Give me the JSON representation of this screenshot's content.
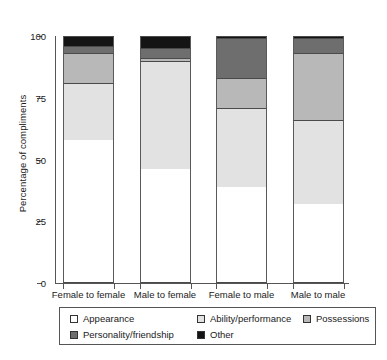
{
  "chart_data": {
    "type": "bar",
    "subtype": "stacked-bar-100-percent",
    "title": "",
    "xlabel": "",
    "ylabel": "Percentage of compliments",
    "ylim": [
      0,
      100
    ],
    "yticks": [
      0,
      25,
      50,
      75,
      100
    ],
    "ytick_labels": [
      "0",
      "25",
      "50",
      "75",
      "100"
    ],
    "grid": false,
    "legend_position": "bottom",
    "stack_order_bottom_to_top": [
      "Appearance",
      "Ability/performance",
      "Possessions",
      "Personality/friendship",
      "Other"
    ],
    "categories": [
      "Female to female",
      "Male to female",
      "Female to male",
      "Male to male"
    ],
    "series": [
      {
        "name": "Appearance",
        "color": "#ffffff",
        "values": [
          58,
          46,
          39,
          32
        ]
      },
      {
        "name": "Ability/performance",
        "color": "#e2e2e2",
        "values": [
          23,
          44,
          32,
          34
        ]
      },
      {
        "name": "Possessions",
        "color": "#b8b8b8",
        "values": [
          12,
          1,
          12,
          27
        ]
      },
      {
        "name": "Personality/friendship",
        "color": "#6e6e6e",
        "values": [
          3,
          4,
          16,
          6
        ]
      },
      {
        "name": "Other",
        "color": "#141414",
        "values": [
          4,
          5,
          1,
          1
        ]
      }
    ]
  },
  "axis": {
    "y_title": "Percentage of compliments",
    "y_ticks": [
      {
        "value": 100,
        "label": "100"
      },
      {
        "value": 75,
        "label": "75"
      },
      {
        "value": 50,
        "label": "50"
      },
      {
        "value": 25,
        "label": "25"
      },
      {
        "value": 0,
        "label": "0"
      }
    ],
    "x_categories": [
      {
        "label": "Female to female"
      },
      {
        "label": "Male to female"
      },
      {
        "label": "Female to male"
      },
      {
        "label": "Male to male"
      }
    ]
  },
  "legend": {
    "entries": [
      {
        "label": "Appearance",
        "color": "#ffffff"
      },
      {
        "label": "Ability/performance",
        "color": "#e2e2e2"
      },
      {
        "label": "Possessions",
        "color": "#b8b8b8"
      },
      {
        "label": "Personality/friendship",
        "color": "#6e6e6e"
      },
      {
        "label": "Other",
        "color": "#141414"
      }
    ]
  }
}
